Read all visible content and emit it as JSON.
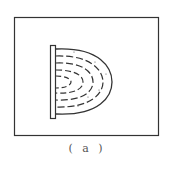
{
  "figure": {
    "caption": "( a )",
    "colors": {
      "stroke": "#333333",
      "background": "#ffffff"
    },
    "elements": {
      "frame": "outer rectangle",
      "plate": "vertical bar",
      "outer_curve": "solid semi-ellipse",
      "inner_curves": [
        "dashed arc 1",
        "dashed arc 2",
        "dashed arc 3",
        "dashed arc 4"
      ]
    }
  }
}
